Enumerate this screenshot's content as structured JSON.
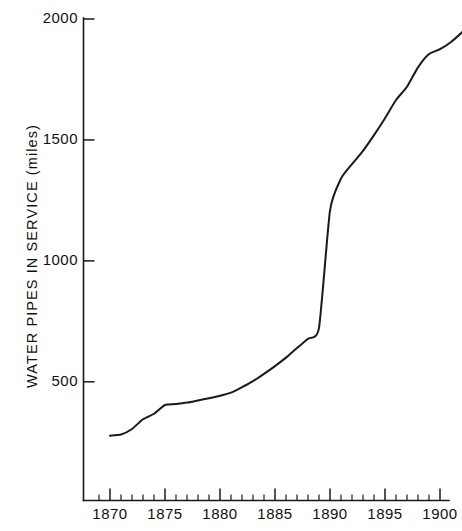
{
  "chart_data": {
    "type": "line",
    "title": "",
    "subtitle": "",
    "xlabel": "",
    "ylabel": "WATER PIPES IN SERVICE (miles)",
    "xlim": [
      1869,
      1903
    ],
    "ylim": [
      0,
      2075
    ],
    "grid": false,
    "legend": null,
    "y_ticks": [
      500,
      1000,
      1500,
      2000
    ],
    "y_tick_labels": [
      "500",
      "1000",
      "1500",
      "2000"
    ],
    "x_ticks": [
      1870,
      1875,
      1880,
      1885,
      1890,
      1895,
      1900
    ],
    "x_tick_labels": [
      "1870",
      "1875",
      "1880",
      "1885",
      "1890",
      "1895",
      "1900"
    ],
    "x_minor_tick_interval": 1,
    "series": [
      {
        "name": "Water pipes in service",
        "color": "#1a1a1a",
        "x": [
          1870,
          1871,
          1872,
          1873,
          1874,
          1875,
          1876,
          1877,
          1878,
          1879,
          1880,
          1881,
          1882,
          1883,
          1884,
          1885,
          1886,
          1887,
          1888,
          1889,
          1890,
          1891,
          1892,
          1893,
          1894,
          1895,
          1896,
          1897,
          1898,
          1899,
          1900,
          1901,
          1902,
          1903
        ],
        "y": [
          277,
          282,
          305,
          345,
          368,
          404,
          408,
          414,
          423,
          432,
          442,
          455,
          478,
          503,
          533,
          565,
          600,
          640,
          678,
          723,
          1208,
          1340,
          1400,
          1455,
          1520,
          1590,
          1665,
          1720,
          1800,
          1855,
          1875,
          1905,
          1945,
          1990
        ]
      }
    ],
    "annotations": [
      {
        "text": "steep rise between 1889 and 1890",
        "x": 1889.5,
        "y": 965
      }
    ]
  },
  "axes": {
    "y_axis_name": "water-pipes-miles-axis",
    "x_axis_name": "year-axis"
  }
}
